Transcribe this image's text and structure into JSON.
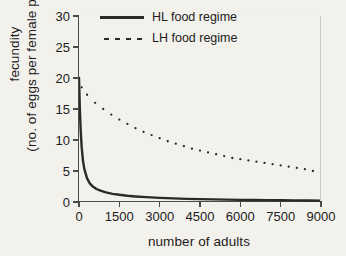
{
  "figure": {
    "background_color": "#f3f1ec",
    "ink_color": "#2a2a28"
  },
  "axis": {
    "x_title": "number of adults",
    "y_title_line1": "fecundity",
    "y_title_line2": "(no. of eggs per female per day)",
    "x_ticks": [
      "0",
      "1500",
      "3000",
      "4500",
      "6000",
      "7500",
      "9000"
    ],
    "y_ticks": [
      "0",
      "5",
      "10",
      "15",
      "20",
      "25",
      "30"
    ]
  },
  "legend": {
    "items": [
      {
        "label": "HL food regime",
        "style": "solid"
      },
      {
        "label": "LH food regime",
        "style": "dotted"
      }
    ]
  },
  "chart_data": {
    "type": "line",
    "title": "",
    "xlabel": "number of adults",
    "ylabel": "fecundity (no. of eggs per female per day)",
    "xlim": [
      0,
      9000
    ],
    "ylim": [
      0,
      30
    ],
    "xticks": [
      0,
      1500,
      3000,
      4500,
      6000,
      7500,
      9000
    ],
    "yticks": [
      0,
      5,
      10,
      15,
      20,
      25,
      30
    ],
    "grid": false,
    "legend_position": "top-right",
    "series": [
      {
        "name": "HL food regime",
        "style": "solid",
        "color": "#2a2a28",
        "x": [
          0,
          30,
          60,
          100,
          150,
          200,
          300,
          400,
          500,
          650,
          800,
          1000,
          1250,
          1500,
          1800,
          2100,
          2500,
          3000,
          3500,
          4000,
          4500,
          5000,
          5500,
          6000,
          6500,
          7000,
          7500,
          8000,
          8500,
          9000
        ],
        "y": [
          20.0,
          15.2,
          11.8,
          8.8,
          6.6,
          5.3,
          3.8,
          3.0,
          2.55,
          2.1,
          1.82,
          1.55,
          1.32,
          1.16,
          1.0,
          0.89,
          0.78,
          0.66,
          0.58,
          0.51,
          0.46,
          0.42,
          0.38,
          0.35,
          0.32,
          0.3,
          0.28,
          0.26,
          0.24,
          0.22
        ]
      },
      {
        "name": "LH food regime",
        "style": "dotted",
        "color": "#2a2a28",
        "x": [
          100,
          300,
          600,
          900,
          1200,
          1500,
          1800,
          2100,
          2400,
          2700,
          3000,
          3300,
          3600,
          3900,
          4200,
          4500,
          4800,
          5100,
          5400,
          5700,
          6000,
          6300,
          6600,
          6900,
          7200,
          7500,
          7800,
          8100,
          8400,
          8700,
          9000
        ],
        "y": [
          18.5,
          17.3,
          16.0,
          15.0,
          14.1,
          13.3,
          12.6,
          11.9,
          11.3,
          10.8,
          10.3,
          9.8,
          9.4,
          9.0,
          8.6,
          8.3,
          8.0,
          7.7,
          7.4,
          7.1,
          6.9,
          6.7,
          6.5,
          6.3,
          6.1,
          5.9,
          5.7,
          5.5,
          5.3,
          5.0,
          4.7
        ]
      }
    ]
  }
}
